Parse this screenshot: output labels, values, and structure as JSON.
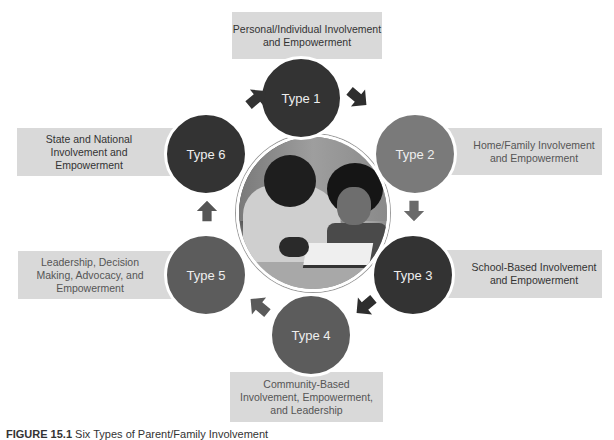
{
  "diagram": {
    "title": "Six Types of Parent/Family Involvement",
    "center_image": "parent-and-child-reading-photo",
    "nodes": [
      {
        "id": "type1",
        "label": "Type 1",
        "description_lines": [
          "Personal/Individual Involvement",
          "and Empowerment"
        ],
        "shade": "#333333"
      },
      {
        "id": "type2",
        "label": "Type 2",
        "description_lines": [
          "Home/Family Involvement",
          "and Empowerment"
        ],
        "shade": "#7a7a7a"
      },
      {
        "id": "type3",
        "label": "Type 3",
        "description_lines": [
          "School-Based Involvement",
          "and Empowerment"
        ],
        "shade": "#333333"
      },
      {
        "id": "type4",
        "label": "Type 4",
        "description_lines": [
          "Community-Based",
          "Involvement, Empowerment,",
          "and Leadership"
        ],
        "shade": "#5c5c5c"
      },
      {
        "id": "type5",
        "label": "Type 5",
        "description_lines": [
          "Leadership, Decision",
          "Making, Advocacy, and",
          "Empowerment"
        ],
        "shade": "#5c5c5c"
      },
      {
        "id": "type6",
        "label": "Type 6",
        "description_lines": [
          "State and National",
          "Involvement and",
          "Empowerment"
        ],
        "shade": "#333333"
      }
    ],
    "flow": [
      "type1 -> type2",
      "type2 -> type3",
      "type3 -> type4",
      "type4 -> type5",
      "type5 -> type6",
      "type6 -> type1"
    ],
    "colors": {
      "label_box_bg": "#d9d9d9",
      "dark_circle": "#333333",
      "mid_circle": "#5c5c5c",
      "light_circle": "#7a7a7a",
      "arrow_dark": "#2e2e2e",
      "arrow_mid": "#5a5a5a",
      "arrow_light": "#777777"
    }
  },
  "caption": {
    "figure_label": "FIGURE 15.1",
    "text": "Six Types of Parent/Family Involvement"
  }
}
